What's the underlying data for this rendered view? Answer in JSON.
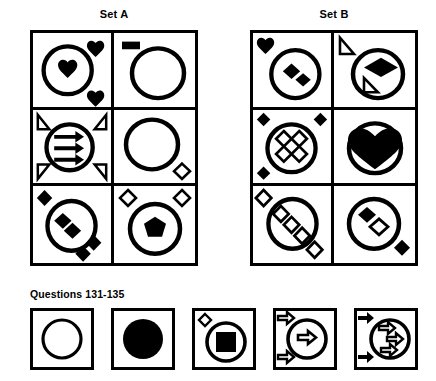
{
  "headings": {
    "set_a": "Set A",
    "set_b": "Set B",
    "questions": "Questions 131-135"
  },
  "colors": {
    "ink": "#000000",
    "paper": "#ffffff"
  },
  "puzzle": {
    "type": "abstract-reasoning-matrix",
    "sets": [
      {
        "name": "Set A",
        "rows": 3,
        "cols": 2,
        "cells": [
          {
            "id": "a-r1-c1",
            "position": "row1-col1",
            "elements": [
              {
                "icon": "circle-outline",
                "fill": "none",
                "inside": true
              },
              {
                "icon": "heart-filled",
                "fill": "solid",
                "inside": true,
                "count": 1
              },
              {
                "icon": "heart-filled",
                "fill": "solid",
                "inside": false,
                "anchor": "top-right"
              },
              {
                "icon": "heart-filled",
                "fill": "solid",
                "inside": false,
                "anchor": "bottom-right"
              }
            ]
          },
          {
            "id": "a-r1-c2",
            "position": "row1-col2",
            "elements": [
              {
                "icon": "circle-outline",
                "fill": "none",
                "inside": true
              },
              {
                "icon": "rectangle-filled",
                "fill": "solid",
                "inside": false,
                "anchor": "top-left"
              }
            ]
          },
          {
            "id": "a-r2-c1",
            "position": "row2-col1",
            "elements": [
              {
                "icon": "circle-outline",
                "fill": "none",
                "inside": true
              },
              {
                "icon": "arrow-right-filled",
                "fill": "solid",
                "inside": true,
                "count": 3
              },
              {
                "icon": "triangle-outline",
                "fill": "none",
                "inside": false,
                "anchor": "top-left"
              },
              {
                "icon": "triangle-outline",
                "fill": "none",
                "inside": false,
                "anchor": "top-right"
              },
              {
                "icon": "triangle-outline",
                "fill": "none",
                "inside": false,
                "anchor": "bottom-left"
              },
              {
                "icon": "triangle-outline",
                "fill": "none",
                "inside": false,
                "anchor": "bottom-right"
              }
            ]
          },
          {
            "id": "a-r2-c2",
            "position": "row2-col2",
            "elements": [
              {
                "icon": "circle-outline",
                "fill": "none",
                "inside": true
              },
              {
                "icon": "diamond-outline",
                "fill": "none",
                "inside": false,
                "anchor": "bottom-right"
              }
            ]
          },
          {
            "id": "a-r3-c1",
            "position": "row3-col1",
            "elements": [
              {
                "icon": "circle-outline",
                "fill": "none",
                "inside": true
              },
              {
                "icon": "diamond-filled",
                "fill": "solid",
                "inside": true,
                "count": 2
              },
              {
                "icon": "diamond-filled",
                "fill": "solid",
                "inside": false,
                "anchor": "top-left"
              },
              {
                "icon": "diamond-filled",
                "fill": "solid",
                "inside": false,
                "anchor": "bottom-right",
                "count": 2
              }
            ]
          },
          {
            "id": "a-r3-c2",
            "position": "row3-col2",
            "elements": [
              {
                "icon": "circle-outline",
                "fill": "none",
                "inside": true
              },
              {
                "icon": "heptagon-filled",
                "fill": "solid",
                "inside": true
              },
              {
                "icon": "diamond-outline",
                "fill": "none",
                "inside": false,
                "anchor": "top-left"
              },
              {
                "icon": "diamond-outline",
                "fill": "none",
                "inside": false,
                "anchor": "top-right"
              }
            ]
          }
        ]
      },
      {
        "name": "Set B",
        "rows": 3,
        "cols": 2,
        "cells": [
          {
            "id": "b-r1-c1",
            "position": "row1-col1",
            "elements": [
              {
                "icon": "circle-outline",
                "fill": "none",
                "inside": true
              },
              {
                "icon": "diamond-filled",
                "fill": "solid",
                "inside": true,
                "count": 2
              },
              {
                "icon": "heart-filled",
                "fill": "solid",
                "inside": false,
                "anchor": "top-left"
              }
            ]
          },
          {
            "id": "b-r1-c2",
            "position": "row1-col2",
            "elements": [
              {
                "icon": "circle-outline",
                "fill": "none",
                "inside": true
              },
              {
                "icon": "diamond-filled",
                "fill": "solid",
                "inside": true,
                "count": 1
              },
              {
                "icon": "triangle-outline",
                "fill": "none",
                "inside": false,
                "anchor": "top-left"
              },
              {
                "icon": "triangle-outline",
                "fill": "none",
                "inside": true,
                "anchor": "bottom-left"
              }
            ]
          },
          {
            "id": "b-r2-c1",
            "position": "row2-col1",
            "elements": [
              {
                "icon": "circle-outline",
                "fill": "none",
                "inside": true
              },
              {
                "icon": "diamond-outline",
                "fill": "none",
                "inside": true,
                "count": 4
              },
              {
                "icon": "diamond-filled",
                "fill": "solid",
                "inside": false,
                "anchor": "top-left"
              },
              {
                "icon": "diamond-filled",
                "fill": "solid",
                "inside": false,
                "anchor": "top-right"
              },
              {
                "icon": "diamond-filled",
                "fill": "solid",
                "inside": false,
                "anchor": "bottom-left"
              }
            ]
          },
          {
            "id": "b-r2-c2",
            "position": "row2-col2",
            "elements": [
              {
                "icon": "circle-outline",
                "fill": "none",
                "inside": true
              },
              {
                "icon": "heart-filled",
                "fill": "solid",
                "inside": true,
                "size": "large"
              }
            ]
          },
          {
            "id": "b-r3-c1",
            "position": "row3-col1",
            "elements": [
              {
                "icon": "circle-outline",
                "fill": "none",
                "inside": true
              },
              {
                "icon": "diamond-outline",
                "fill": "none",
                "inside": true,
                "count": 3
              },
              {
                "icon": "diamond-outline",
                "fill": "none",
                "inside": false,
                "anchor": "top-left"
              },
              {
                "icon": "diamond-outline",
                "fill": "none",
                "inside": false,
                "anchor": "bottom-right"
              }
            ]
          },
          {
            "id": "b-r3-c2",
            "position": "row3-col2",
            "elements": [
              {
                "icon": "circle-outline",
                "fill": "none",
                "inside": true
              },
              {
                "icon": "diamond-filled",
                "fill": "solid",
                "inside": true,
                "count": 1
              },
              {
                "icon": "diamond-outline",
                "fill": "none",
                "inside": true,
                "count": 1
              },
              {
                "icon": "diamond-filled",
                "fill": "solid",
                "inside": false,
                "anchor": "bottom-right"
              }
            ]
          }
        ]
      }
    ],
    "options": [
      {
        "label": "A",
        "id": "option-1",
        "elements": [
          {
            "icon": "circle-outline",
            "fill": "none"
          }
        ]
      },
      {
        "label": "B",
        "id": "option-2",
        "elements": [
          {
            "icon": "circle-filled",
            "fill": "solid"
          }
        ]
      },
      {
        "label": "C",
        "id": "option-3",
        "elements": [
          {
            "icon": "circle-outline",
            "fill": "none"
          },
          {
            "icon": "square-filled",
            "fill": "solid",
            "inside": true
          },
          {
            "icon": "diamond-outline",
            "fill": "none",
            "inside": false,
            "anchor": "top-left"
          }
        ]
      },
      {
        "label": "D",
        "id": "option-4",
        "elements": [
          {
            "icon": "circle-outline",
            "fill": "none"
          },
          {
            "icon": "arrow-right-outline",
            "fill": "none",
            "inside": true,
            "count": 1
          },
          {
            "icon": "arrow-right-outline",
            "fill": "none",
            "inside": false,
            "anchor": "top-left"
          },
          {
            "icon": "arrow-right-outline",
            "fill": "none",
            "inside": false,
            "anchor": "bottom-left"
          }
        ]
      },
      {
        "label": "E",
        "id": "option-5",
        "elements": [
          {
            "icon": "circle-outline",
            "fill": "none"
          },
          {
            "icon": "arrow-right-outline",
            "fill": "none",
            "inside": true,
            "count": 3
          },
          {
            "icon": "arrow-right-filled",
            "fill": "solid",
            "inside": false,
            "anchor": "top-left"
          },
          {
            "icon": "arrow-right-filled",
            "fill": "solid",
            "inside": false,
            "anchor": "bottom-left"
          }
        ]
      }
    ]
  }
}
